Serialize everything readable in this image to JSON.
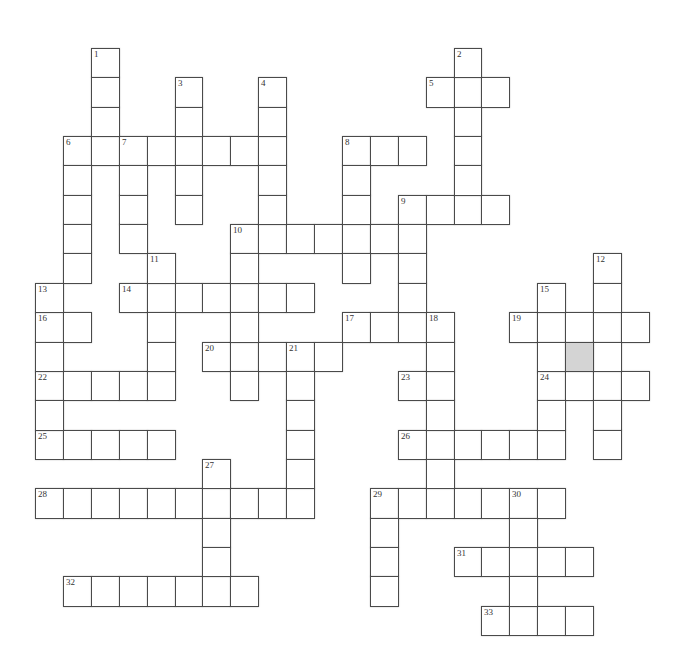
{
  "puzzle": {
    "grid": {
      "origin_x": 35,
      "origin_y": 48,
      "cell_w": 27.9,
      "cell_h": 29.35,
      "border_color": "#4a4a4a",
      "shaded_color": "#d4d4d4"
    },
    "across": [
      {
        "number": "5",
        "row": 1,
        "col": 14,
        "length": 3
      },
      {
        "number": "6",
        "row": 3,
        "col": 1,
        "length": 8
      },
      {
        "number": "8",
        "row": 3,
        "col": 11,
        "length": 3
      },
      {
        "number": "9",
        "row": 5,
        "col": 13,
        "length": 4
      },
      {
        "number": "10",
        "row": 6,
        "col": 7,
        "length": 7
      },
      {
        "number": "14",
        "row": 8,
        "col": 3,
        "length": 7
      },
      {
        "number": "16",
        "row": 9,
        "col": 0,
        "length": 2
      },
      {
        "number": "17",
        "row": 9,
        "col": 11,
        "length": 4
      },
      {
        "number": "19",
        "row": 9,
        "col": 17,
        "length": 5
      },
      {
        "number": "20",
        "row": 10,
        "col": 6,
        "length": 5
      },
      {
        "number": "22",
        "row": 11,
        "col": 0,
        "length": 5
      },
      {
        "number": "23",
        "row": 11,
        "col": 13,
        "length": 2
      },
      {
        "number": "24",
        "row": 11,
        "col": 18,
        "length": 4
      },
      {
        "number": "25",
        "row": 13,
        "col": 0,
        "length": 5
      },
      {
        "number": "26",
        "row": 13,
        "col": 13,
        "length": 6
      },
      {
        "number": "28",
        "row": 15,
        "col": 0,
        "length": 10
      },
      {
        "number": "29",
        "row": 15,
        "col": 12,
        "length": 7
      },
      {
        "number": "31",
        "row": 17,
        "col": 15,
        "length": 5
      },
      {
        "number": "32",
        "row": 18,
        "col": 1,
        "length": 7
      },
      {
        "number": "33",
        "row": 19,
        "col": 16,
        "length": 4
      }
    ],
    "down": [
      {
        "number": "1",
        "row": 0,
        "col": 2,
        "length": 4
      },
      {
        "number": "2",
        "row": 0,
        "col": 15,
        "length": 6
      },
      {
        "number": "3",
        "row": 1,
        "col": 5,
        "length": 5
      },
      {
        "number": "4",
        "row": 1,
        "col": 8,
        "length": 6
      },
      {
        "number": "6",
        "row": 3,
        "col": 1,
        "length": 5
      },
      {
        "number": "7",
        "row": 3,
        "col": 3,
        "length": 4
      },
      {
        "number": "8",
        "row": 3,
        "col": 11,
        "length": 5
      },
      {
        "number": "9",
        "row": 5,
        "col": 13,
        "length": 5
      },
      {
        "number": "10",
        "row": 6,
        "col": 7,
        "length": 6
      },
      {
        "number": "11",
        "row": 7,
        "col": 4,
        "length": 5
      },
      {
        "number": "12",
        "row": 7,
        "col": 20,
        "length": 7
      },
      {
        "number": "13",
        "row": 8,
        "col": 0,
        "length": 6
      },
      {
        "number": "15",
        "row": 8,
        "col": 18,
        "length": 6
      },
      {
        "number": "18",
        "row": 9,
        "col": 14,
        "length": 7
      },
      {
        "number": "21",
        "row": 10,
        "col": 9,
        "length": 6
      },
      {
        "number": "27",
        "row": 14,
        "col": 6,
        "length": 5
      },
      {
        "number": "29",
        "row": 15,
        "col": 12,
        "length": 4
      },
      {
        "number": "30",
        "row": 15,
        "col": 17,
        "length": 5
      }
    ],
    "shaded_cells": [
      {
        "row": 10,
        "col": 19
      }
    ]
  }
}
